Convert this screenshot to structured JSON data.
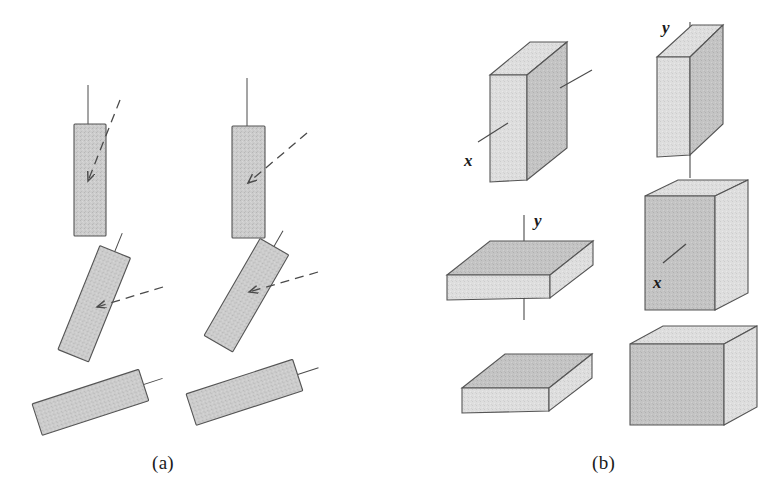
{
  "figure": {
    "background_color": "#ffffff",
    "width": 780,
    "height": 500,
    "colors": {
      "fill_gray": "#c9c9c9",
      "fill_light_gray": "#dcdcdc",
      "fill_mid_gray": "#c2c2c2",
      "stroke": "#4a4a4a",
      "text": "#1a1a1a"
    }
  },
  "panels": [
    {
      "id": "panel-a",
      "caption": "(a)",
      "description": "Six shaded rectangles in a 3x2 grid showing progressive rotation, each with a solid reference axis line and most with a dashed direction arrow",
      "items": [
        {
          "name": "bar-upright-left",
          "rotation_deg": 0,
          "has_axis_line": true,
          "has_dashed_arrow": true,
          "arrow_style": "dashed-steep"
        },
        {
          "name": "bar-upright-right",
          "rotation_deg": 0,
          "has_axis_line": true,
          "has_dashed_arrow": true,
          "arrow_style": "dashed-shallow"
        },
        {
          "name": "bar-tilted-left",
          "rotation_deg": 22,
          "has_axis_line": true,
          "has_dashed_arrow": true,
          "arrow_style": "dashed-shallow"
        },
        {
          "name": "bar-tilted-right",
          "rotation_deg": 30,
          "has_axis_line": true,
          "has_dashed_arrow": true,
          "arrow_style": "dashed-flat"
        },
        {
          "name": "bar-flat-left",
          "rotation_deg": 72,
          "has_axis_line": true,
          "has_dashed_arrow": false,
          "arrow_style": "none"
        },
        {
          "name": "bar-flat-right",
          "rotation_deg": 72,
          "has_axis_line": true,
          "has_dashed_arrow": false,
          "arrow_style": "none"
        }
      ]
    },
    {
      "id": "panel-b",
      "caption": "(b)",
      "description": "Six shaded 3D rectangular blocks in a 3x2 grid, some annotated with x or y axis lines",
      "items": [
        {
          "name": "block-plate-vertical-left",
          "shape": "thin upright plate",
          "axis_label": "x",
          "axis_line": "diagonal"
        },
        {
          "name": "block-plate-vertical-right",
          "shape": "thin upright plate",
          "axis_label": "y",
          "axis_line": "vertical"
        },
        {
          "name": "block-slab-flat-left",
          "shape": "flat horizontal slab",
          "axis_label": "y",
          "axis_line": "vertical"
        },
        {
          "name": "block-box-upright-right",
          "shape": "upright box",
          "axis_label": "x",
          "axis_line": "diagonal"
        },
        {
          "name": "block-slab-flat-bottom",
          "shape": "flat horizontal slab",
          "axis_label": "",
          "axis_line": "none"
        },
        {
          "name": "block-box-wide-bottom",
          "shape": "wide box",
          "axis_label": "",
          "axis_line": "none"
        }
      ],
      "axis_labels": [
        "x",
        "y",
        "y",
        "x"
      ]
    }
  ]
}
